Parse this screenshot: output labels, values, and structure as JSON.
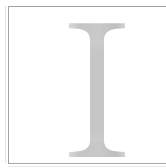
{
  "page": {
    "kind": "scanned-book-page-dropcap",
    "background_color": "#ffffff",
    "width": 166,
    "height": 168
  },
  "frame": {
    "name": "page-border-rule",
    "border_color": "#a2a2a4",
    "inner_fill": "#ffffff",
    "left": 8,
    "top": 6,
    "width": 158,
    "height": 158
  },
  "dropcap": {
    "character": "I",
    "style": "serif-capital-initial",
    "ink_color": "#c6c7c9",
    "ink_color_light": "#d5d6d8",
    "ink_color_dark": "#b9babc",
    "glyph_left": 68,
    "glyph_right": 117,
    "glyph_top": 22,
    "glyph_bottom": 150,
    "stem_left": 81,
    "stem_right": 103
  }
}
